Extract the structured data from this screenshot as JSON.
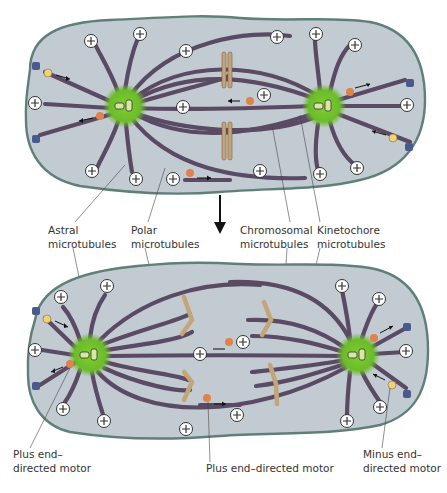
{
  "figure": {
    "stages": [
      "metaphase spindle (top)",
      "anaphase spindle (bottom)"
    ],
    "transition_arrow": "down-arrow"
  },
  "labels": {
    "astral": [
      "Astral",
      "microtubules"
    ],
    "polar": [
      "Polar",
      "microtubules"
    ],
    "chromosomal": [
      "Chromosomal",
      "microtubules"
    ],
    "kinetochore": [
      "Kinetochore",
      "microtubules"
    ],
    "plus_motor_left": [
      "Plus end–",
      "directed motor"
    ],
    "plus_motor_center": [
      "Plus end–directed motor"
    ],
    "minus_motor_right": [
      "Minus end–",
      "directed motor"
    ]
  },
  "colors": {
    "cell_fill": "#c3cbd2",
    "cell_border": "#5f7f79",
    "centrosome": "#6fbf2e",
    "microtubule": "#5a4a64",
    "chromosome": "#c4a57a",
    "plus_motor": "#e0834a",
    "minus_motor": "#f0d27a",
    "anchor": "#4a5a8c"
  },
  "symbols": {
    "plus_end": "⊕"
  }
}
